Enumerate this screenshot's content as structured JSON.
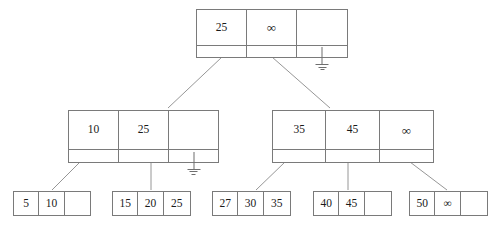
{
  "diagram": {
    "type": "b-plus-tree",
    "title": "",
    "symbols": {
      "infinity": "∞",
      "null_pointer": "ground-symbol"
    },
    "colors": {
      "stroke": "#7a7a7a",
      "text": "#1a1a1a",
      "background": "#ffffff"
    }
  },
  "root": {
    "name": "root-node",
    "keys": [
      "25",
      "∞",
      ""
    ],
    "pointers": [
      "link",
      "link",
      "null"
    ]
  },
  "internal": [
    {
      "name": "internal-node-left",
      "keys": [
        "10",
        "25",
        ""
      ],
      "pointers": [
        "link",
        "link",
        "null"
      ]
    },
    {
      "name": "internal-node-right",
      "keys": [
        "35",
        "45",
        "∞"
      ],
      "pointers": [
        "link",
        "link",
        "link"
      ]
    }
  ],
  "leaves": [
    {
      "name": "leaf-node-1",
      "values": [
        "5",
        "10",
        ""
      ]
    },
    {
      "name": "leaf-node-2",
      "values": [
        "15",
        "20",
        "25"
      ]
    },
    {
      "name": "leaf-node-3",
      "values": [
        "27",
        "30",
        "35"
      ]
    },
    {
      "name": "leaf-node-4",
      "values": [
        "40",
        "45",
        ""
      ]
    },
    {
      "name": "leaf-node-5",
      "values": [
        "50",
        "∞",
        ""
      ]
    }
  ]
}
